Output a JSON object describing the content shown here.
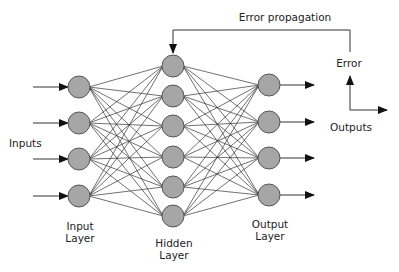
{
  "title": "Error propagation",
  "labels": {
    "inputs": "Inputs",
    "input_layer": [
      "Input",
      "Layer"
    ],
    "hidden_layer": [
      "Hidden",
      "Layer"
    ],
    "output_layer": [
      "Output",
      "Layer"
    ],
    "error": "Error",
    "outputs": "Outputs"
  },
  "colors": {
    "node_fill": "#a6a6a6",
    "node_stroke": "#555555",
    "edge": "#333333",
    "text": "#222222"
  },
  "network": {
    "node_radius": 11,
    "layers": [
      {
        "name": "input",
        "x": 79,
        "ys": [
          87,
          123,
          159,
          196
        ]
      },
      {
        "name": "hidden",
        "x": 173,
        "ys": [
          66,
          96,
          126,
          157,
          187,
          216
        ]
      },
      {
        "name": "output",
        "x": 269,
        "ys": [
          85,
          122,
          158,
          195
        ]
      }
    ]
  }
}
